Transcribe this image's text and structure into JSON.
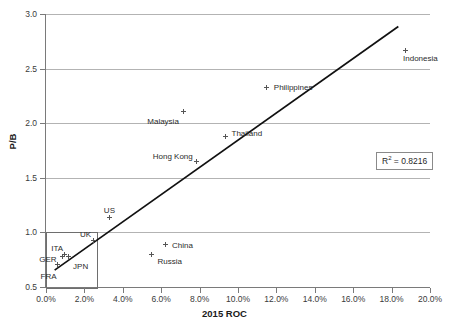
{
  "chart_data": {
    "type": "scatter",
    "title": "",
    "xlabel": "2015 ROC",
    "ylabel": "P/B",
    "xlim": [
      0,
      20
    ],
    "ylim": [
      0.5,
      3.0
    ],
    "x_tick_labels": [
      "0.0%",
      "2.0%",
      "4.0%",
      "6.0%",
      "8.0%",
      "10.0%",
      "12.0%",
      "14.0%",
      "16.0%",
      "18.0%",
      "20.0%"
    ],
    "x_tick_values": [
      0,
      2,
      4,
      6,
      8,
      10,
      12,
      14,
      16,
      18,
      20
    ],
    "y_tick_labels": [
      "0.5",
      "1.0",
      "1.5",
      "2.0",
      "2.5",
      "3.0"
    ],
    "y_tick_values": [
      0.5,
      1.0,
      1.5,
      2.0,
      2.5,
      3.0
    ],
    "grid": "horizontal",
    "legend": "none",
    "points": [
      {
        "name": "Indonesia",
        "x": 18.7,
        "y": 2.67,
        "label_dx": -2,
        "label_dy": 9,
        "label_anchor": "start"
      },
      {
        "name": "Philippines",
        "x": 11.5,
        "y": 2.33,
        "label_dx": 7,
        "label_dy": 1,
        "label_anchor": "start"
      },
      {
        "name": "Malaysia",
        "x": 7.15,
        "y": 2.11,
        "label_dx": -4,
        "label_dy": 11,
        "label_anchor": "end"
      },
      {
        "name": "Thailand",
        "x": 9.35,
        "y": 1.88,
        "label_dx": 6,
        "label_dy": -2,
        "label_anchor": "start"
      },
      {
        "name": "Hong Kong",
        "x": 7.85,
        "y": 1.65,
        "label_dx": -4,
        "label_dy": -4,
        "label_anchor": "end"
      },
      {
        "name": "US",
        "x": 3.3,
        "y": 1.14,
        "label_dx": 0,
        "label_dy": -6,
        "label_anchor": "middle"
      },
      {
        "name": "China",
        "x": 6.2,
        "y": 0.885,
        "label_dx": 7,
        "label_dy": 1,
        "label_anchor": "start"
      },
      {
        "name": "Russia",
        "x": 5.5,
        "y": 0.8,
        "label_dx": 6,
        "label_dy": 8,
        "label_anchor": "start"
      },
      {
        "name": "UK",
        "x": 2.45,
        "y": 0.93,
        "label_dx": -2,
        "label_dy": -5,
        "label_anchor": "end"
      },
      {
        "name": "JPN",
        "x": 1.15,
        "y": 0.775,
        "label_dx": 5,
        "label_dy": 10,
        "label_anchor": "start"
      },
      {
        "name": "ITA",
        "x": 0.95,
        "y": 0.8,
        "label_dx": -1,
        "label_dy": -5,
        "label_anchor": "end"
      },
      {
        "name": "GER",
        "x": 0.85,
        "y": 0.775,
        "label_dx": -6,
        "label_dy": 3,
        "label_anchor": "end"
      },
      {
        "name": "FRA",
        "x": 0.6,
        "y": 0.705,
        "label_dx": -1,
        "label_dy": 12,
        "label_anchor": "end"
      }
    ],
    "trendline": {
      "x0": 0.45,
      "y0": 0.655,
      "x1": 18.35,
      "y1": 2.885
    },
    "annotations": [
      {
        "name": "r2-annotation",
        "text_prefix": "R",
        "text_sup": "2",
        "text_suffix": " = 0.8216"
      }
    ],
    "inset_box": {
      "name": "developed-markets-highlight",
      "x0": 0.0,
      "y0": 0.5,
      "x1": 2.6,
      "y1": 1.0
    }
  }
}
